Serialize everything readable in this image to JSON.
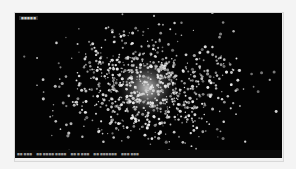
{
  "viewer": {
    "title_label": "■■■■■",
    "background_color": "#030303"
  },
  "star_field": {
    "description": "globular star cluster",
    "center_x": 132,
    "center_y": 75,
    "spread_x": 42,
    "spread_y": 28,
    "star_count": 900,
    "core_glow_color": "#ffffff",
    "star_color": "#e8e8e8",
    "seed": 7
  },
  "statusbar": {
    "items": [
      "■■ ■■■",
      "■■ ■■■■ ■■■■",
      "■■ ■ ■■■",
      "■■ ■■■■■■",
      "■■■ ■■■"
    ]
  }
}
